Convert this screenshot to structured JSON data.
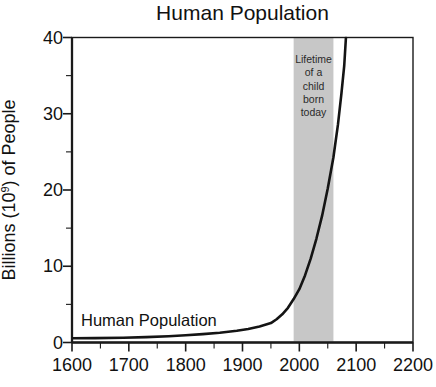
{
  "window": {
    "width": 436,
    "height": 387,
    "background": "#ffffff"
  },
  "chart_data": {
    "type": "line",
    "title": "Human Population",
    "xlabel": "",
    "ylabel": "Billions (10⁹) of People",
    "ylabel_parts": {
      "pre": "Billions (10",
      "sup": "9",
      "post": ") of People"
    },
    "xlim": [
      1600,
      2200
    ],
    "ylim": [
      0,
      40
    ],
    "x_major_ticks": [
      1600,
      1700,
      1800,
      1900,
      2000,
      2100,
      2200
    ],
    "x_minor_ticks": [
      1650,
      1750,
      1850,
      1950,
      2050,
      2150
    ],
    "y_major_ticks": [
      0,
      10,
      20,
      30,
      40
    ],
    "y_minor_ticks": [
      5,
      15,
      25,
      35
    ],
    "grid": false,
    "legend_position": "none",
    "axis_color": "#1a1a1a",
    "tick_label_color": "#111111",
    "series": [
      {
        "name": "Human Population",
        "label_in_plot": "Human Population",
        "color": "#141414",
        "points": [
          [
            1600,
            0.55
          ],
          [
            1640,
            0.58
          ],
          [
            1690,
            0.63
          ],
          [
            1730,
            0.7
          ],
          [
            1770,
            0.82
          ],
          [
            1800,
            0.95
          ],
          [
            1830,
            1.1
          ],
          [
            1860,
            1.28
          ],
          [
            1890,
            1.55
          ],
          [
            1910,
            1.78
          ],
          [
            1930,
            2.1
          ],
          [
            1950,
            2.55
          ],
          [
            1960,
            3.05
          ],
          [
            1970,
            3.7
          ],
          [
            1980,
            4.55
          ],
          [
            1990,
            5.7
          ],
          [
            2000,
            7.0
          ],
          [
            2010,
            8.8
          ],
          [
            2020,
            11.0
          ],
          [
            2030,
            13.6
          ],
          [
            2040,
            16.6
          ],
          [
            2050,
            20.2
          ],
          [
            2060,
            24.3
          ],
          [
            2068,
            28.6
          ],
          [
            2074,
            32.6
          ],
          [
            2079,
            36.3
          ],
          [
            2082,
            40.0
          ]
        ]
      }
    ],
    "annotation_band": {
      "x_start": 1990,
      "x_end": 2060,
      "fill": "#c7c7c7",
      "label_lines": [
        "Lifetime",
        "of a",
        "child",
        "born",
        "today"
      ],
      "label_color": "#2a2a2a"
    }
  }
}
